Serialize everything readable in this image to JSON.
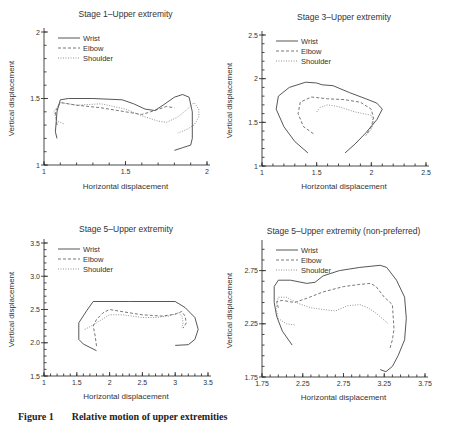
{
  "caption": {
    "label": "Figure 1",
    "text": "Relative motion of upper extremities"
  },
  "chart_data": [
    {
      "type": "line",
      "title": "Stage 1–Upper extremity",
      "xlabel": "Horizontal displacement",
      "ylabel": "Vertical displacement",
      "xlim": [
        1,
        2
      ],
      "ylim": [
        1,
        2
      ],
      "xticks": [
        1,
        1.5,
        2
      ],
      "yticks": [
        1,
        1.5,
        2
      ],
      "xtick_labels": [
        "1",
        "1.5",
        "2"
      ],
      "ytick_labels": [
        "1",
        "1.5",
        "2"
      ],
      "legend": [
        "Wrist",
        "Elbow",
        "Shoulder"
      ],
      "legend_position": "top-left",
      "series": [
        {
          "name": "Wrist",
          "points": [
            [
              1.08,
              1.2
            ],
            [
              1.07,
              1.25
            ],
            [
              1.08,
              1.4
            ],
            [
              1.1,
              1.49
            ],
            [
              1.15,
              1.5
            ],
            [
              1.3,
              1.5
            ],
            [
              1.48,
              1.49
            ],
            [
              1.55,
              1.46
            ],
            [
              1.62,
              1.42
            ],
            [
              1.68,
              1.41
            ],
            [
              1.73,
              1.45
            ],
            [
              1.8,
              1.51
            ],
            [
              1.85,
              1.53
            ],
            [
              1.89,
              1.51
            ],
            [
              1.91,
              1.4
            ],
            [
              1.91,
              1.2
            ],
            [
              1.9,
              1.15
            ],
            [
              1.85,
              1.13
            ],
            [
              1.8,
              1.11
            ]
          ]
        },
        {
          "name": "Elbow",
          "points": [
            [
              1.08,
              1.3
            ],
            [
              1.07,
              1.4
            ],
            [
              1.1,
              1.47
            ],
            [
              1.2,
              1.45
            ],
            [
              1.35,
              1.43
            ],
            [
              1.5,
              1.4
            ],
            [
              1.6,
              1.38
            ],
            [
              1.68,
              1.41
            ],
            [
              1.75,
              1.44
            ],
            [
              1.8,
              1.43
            ]
          ]
        },
        {
          "name": "Shoulder",
          "points": [
            [
              1.12,
              1.31
            ],
            [
              1.08,
              1.33
            ],
            [
              1.06,
              1.4
            ],
            [
              1.1,
              1.47
            ],
            [
              1.2,
              1.45
            ],
            [
              1.35,
              1.46
            ],
            [
              1.5,
              1.42
            ],
            [
              1.6,
              1.37
            ],
            [
              1.7,
              1.33
            ],
            [
              1.75,
              1.32
            ],
            [
              1.82,
              1.36
            ],
            [
              1.88,
              1.42
            ],
            [
              1.92,
              1.47
            ],
            [
              1.95,
              1.42
            ],
            [
              1.95,
              1.36
            ],
            [
              1.92,
              1.3
            ],
            [
              1.88,
              1.27
            ],
            [
              1.82,
              1.24
            ]
          ]
        }
      ]
    },
    {
      "type": "line",
      "title": "Stage 3–Upper extremity",
      "xlabel": "Horizontal displacement",
      "ylabel": "Vertical displacement",
      "xlim": [
        1,
        2.5
      ],
      "ylim": [
        1,
        2.5
      ],
      "xticks": [
        1,
        1.5,
        2,
        2.5
      ],
      "yticks": [
        1,
        1.5,
        2,
        2.5
      ],
      "xtick_labels": [
        "1",
        "1.5",
        "2",
        "2.5"
      ],
      "ytick_labels": [
        "1",
        "1.5",
        "2",
        "2.5"
      ],
      "legend": [
        "Wrist",
        "Elbow",
        "Shoulder"
      ],
      "legend_position": "top-left",
      "series": [
        {
          "name": "Wrist",
          "points": [
            [
              1.42,
              1.15
            ],
            [
              1.3,
              1.28
            ],
            [
              1.2,
              1.45
            ],
            [
              1.13,
              1.65
            ],
            [
              1.15,
              1.8
            ],
            [
              1.25,
              1.9
            ],
            [
              1.4,
              1.96
            ],
            [
              1.5,
              1.95
            ],
            [
              1.55,
              1.93
            ],
            [
              1.65,
              1.92
            ],
            [
              1.8,
              1.84
            ],
            [
              1.95,
              1.77
            ],
            [
              2.05,
              1.72
            ],
            [
              2.1,
              1.65
            ],
            [
              2.05,
              1.53
            ],
            [
              1.95,
              1.38
            ],
            [
              1.85,
              1.25
            ],
            [
              1.76,
              1.15
            ]
          ]
        },
        {
          "name": "Elbow",
          "points": [
            [
              1.47,
              1.37
            ],
            [
              1.38,
              1.45
            ],
            [
              1.33,
              1.6
            ],
            [
              1.35,
              1.73
            ],
            [
              1.45,
              1.79
            ],
            [
              1.6,
              1.77
            ],
            [
              1.75,
              1.76
            ],
            [
              1.9,
              1.73
            ],
            [
              2.0,
              1.65
            ],
            [
              2.02,
              1.55
            ],
            [
              2.0,
              1.45
            ],
            [
              1.95,
              1.35
            ]
          ]
        },
        {
          "name": "Shoulder",
          "points": [
            [
              1.5,
              1.62
            ],
            [
              1.53,
              1.67
            ],
            [
              1.6,
              1.7
            ],
            [
              1.7,
              1.68
            ],
            [
              1.85,
              1.62
            ],
            [
              2.0,
              1.58
            ],
            [
              2.02,
              1.5
            ],
            [
              2.0,
              1.42
            ],
            [
              1.95,
              1.35
            ]
          ]
        }
      ]
    },
    {
      "type": "line",
      "title": "Stage 5–Upper extremity",
      "xlabel": "Horizontal displacement",
      "ylabel": "Vertical displacement",
      "xlim": [
        1,
        3.5
      ],
      "ylim": [
        1.5,
        3.5
      ],
      "xticks": [
        1,
        1.5,
        2,
        2.5,
        3,
        3.5
      ],
      "yticks": [
        1.5,
        2.0,
        2.5,
        3.0,
        3.5
      ],
      "xtick_labels": [
        "1",
        "1.5",
        "2",
        "2.5",
        "3",
        "3.5"
      ],
      "ytick_labels": [
        "1.5",
        "2.0",
        "2.5",
        "3.0",
        "3.5"
      ],
      "legend": [
        "Wrist",
        "Elbow",
        "Shoulder"
      ],
      "legend_position": "top-left",
      "series": [
        {
          "name": "Wrist",
          "points": [
            [
              1.8,
              1.88
            ],
            [
              1.6,
              1.98
            ],
            [
              1.53,
              2.05
            ],
            [
              1.53,
              2.3
            ],
            [
              1.65,
              2.48
            ],
            [
              1.75,
              2.62
            ],
            [
              2.3,
              2.62
            ],
            [
              3.0,
              2.62
            ],
            [
              3.15,
              2.53
            ],
            [
              3.3,
              2.38
            ],
            [
              3.35,
              2.2
            ],
            [
              3.3,
              2.05
            ],
            [
              3.2,
              1.97
            ],
            [
              3.0,
              1.96
            ]
          ]
        },
        {
          "name": "Elbow",
          "points": [
            [
              1.8,
              1.95
            ],
            [
              1.78,
              2.1
            ],
            [
              1.75,
              2.25
            ],
            [
              1.8,
              2.35
            ],
            [
              1.9,
              2.45
            ],
            [
              2.0,
              2.5
            ],
            [
              2.3,
              2.45
            ],
            [
              2.5,
              2.42
            ],
            [
              2.8,
              2.4
            ],
            [
              3.0,
              2.43
            ],
            [
              3.1,
              2.47
            ],
            [
              3.15,
              2.4
            ],
            [
              3.17,
              2.3
            ],
            [
              3.12,
              2.22
            ]
          ]
        },
        {
          "name": "Shoulder",
          "points": [
            [
              1.62,
              2.2
            ],
            [
              1.7,
              2.24
            ],
            [
              1.8,
              2.3
            ],
            [
              2.0,
              2.42
            ],
            [
              2.2,
              2.42
            ],
            [
              2.5,
              2.38
            ],
            [
              2.7,
              2.38
            ],
            [
              2.9,
              2.4
            ],
            [
              3.05,
              2.45
            ],
            [
              3.1,
              2.4
            ],
            [
              3.12,
              2.3
            ],
            [
              3.1,
              2.22
            ]
          ]
        }
      ]
    },
    {
      "type": "line",
      "title": "Stage 5–Upper extremity (non-preferred)",
      "xlabel": "Horizontal displacement",
      "ylabel": "Vertical displacement",
      "xlim": [
        1.75,
        3.75
      ],
      "ylim": [
        1.75,
        3.0
      ],
      "xticks": [
        1.75,
        2.25,
        2.75,
        3.25,
        3.75
      ],
      "yticks": [
        1.75,
        2.25,
        2.75
      ],
      "xtick_labels": [
        "1.75",
        "2.25",
        "2.75",
        "3.25",
        "3.75"
      ],
      "ytick_labels": [
        "1.75",
        "2.25",
        "2.75"
      ],
      "legend": [
        "Wrist",
        "Elbow",
        "Shoulder"
      ],
      "legend_position": "top-left",
      "series": [
        {
          "name": "Wrist",
          "points": [
            [
              2.12,
              2.05
            ],
            [
              2.0,
              2.18
            ],
            [
              1.93,
              2.32
            ],
            [
              1.9,
              2.45
            ],
            [
              1.9,
              2.6
            ],
            [
              1.95,
              2.66
            ],
            [
              2.1,
              2.66
            ],
            [
              2.3,
              2.63
            ],
            [
              2.4,
              2.64
            ],
            [
              2.5,
              2.7
            ],
            [
              2.7,
              2.75
            ],
            [
              2.95,
              2.78
            ],
            [
              3.2,
              2.8
            ],
            [
              3.28,
              2.78
            ],
            [
              3.4,
              2.66
            ],
            [
              3.5,
              2.5
            ],
            [
              3.52,
              2.3
            ],
            [
              3.5,
              2.1
            ],
            [
              3.42,
              1.95
            ],
            [
              3.35,
              1.85
            ],
            [
              3.27,
              1.8
            ],
            [
              3.2,
              1.82
            ]
          ]
        },
        {
          "name": "Elbow",
          "points": [
            [
              1.95,
              2.4
            ],
            [
              1.93,
              2.46
            ],
            [
              2.0,
              2.47
            ],
            [
              2.15,
              2.45
            ],
            [
              2.3,
              2.49
            ],
            [
              2.5,
              2.55
            ],
            [
              2.75,
              2.6
            ],
            [
              2.95,
              2.62
            ],
            [
              3.08,
              2.63
            ],
            [
              3.15,
              2.6
            ],
            [
              3.25,
              2.5
            ],
            [
              3.35,
              2.43
            ],
            [
              3.37,
              2.2
            ],
            [
              3.35,
              2.1
            ],
            [
              3.32,
              2.02
            ]
          ]
        },
        {
          "name": "Shoulder",
          "points": [
            [
              2.15,
              2.24
            ],
            [
              2.05,
              2.25
            ],
            [
              1.95,
              2.3
            ],
            [
              1.92,
              2.4
            ],
            [
              1.95,
              2.5
            ],
            [
              2.05,
              2.5
            ],
            [
              2.2,
              2.44
            ],
            [
              2.35,
              2.4
            ],
            [
              2.55,
              2.38
            ],
            [
              2.65,
              2.37
            ],
            [
              2.8,
              2.42
            ],
            [
              2.95,
              2.43
            ],
            [
              3.05,
              2.4
            ],
            [
              3.15,
              2.35
            ],
            [
              3.3,
              2.25
            ]
          ]
        }
      ]
    }
  ]
}
